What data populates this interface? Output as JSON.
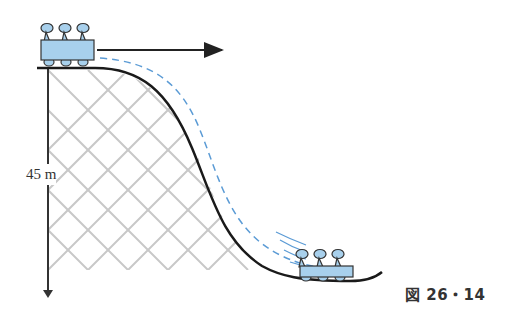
{
  "figure": {
    "height_label": "45 m",
    "caption": "図 26・14"
  },
  "colors": {
    "track": "#1a1a1a",
    "lattice": "#c8c8c8",
    "dashed_path": "#5b9bd5",
    "cart_fill": "#a8d0ec",
    "cart_stroke": "#333333",
    "velocity_arrow": "#222222"
  }
}
